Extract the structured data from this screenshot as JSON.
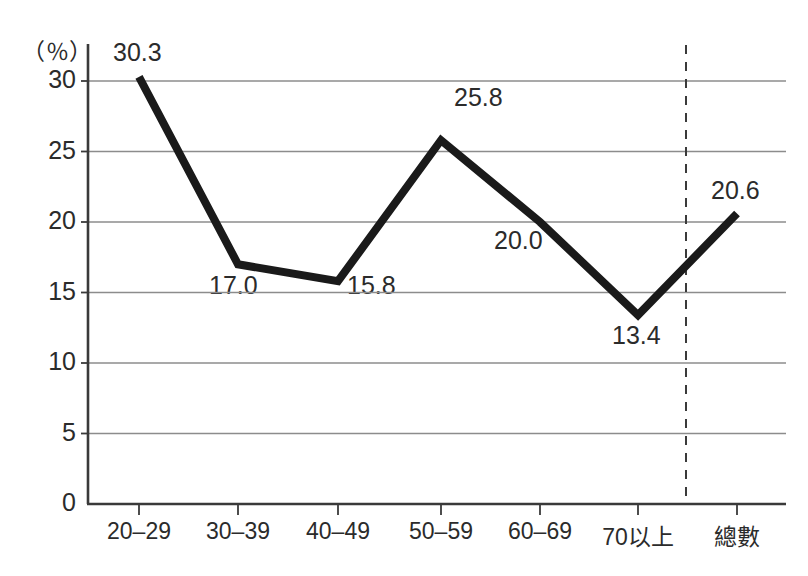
{
  "chart_data": {
    "type": "line",
    "title": "",
    "subtitle": "",
    "xlabel": "",
    "ylabel": "",
    "y_unit_label": "（％）",
    "categories": [
      "20–29",
      "30–39",
      "40–49",
      "50–59",
      "60–69",
      "70以上",
      "總數"
    ],
    "values": [
      30.3,
      17.0,
      15.8,
      25.8,
      20.0,
      13.4,
      20.6
    ],
    "point_labels": [
      "30.3",
      "17.0",
      "15.8",
      "25.8",
      "20.0",
      "13.4",
      "20.6"
    ],
    "ylim": [
      0,
      32
    ],
    "y_ticks": [
      0,
      5,
      10,
      15,
      20,
      25,
      30
    ],
    "y_tick_labels": [
      "0",
      "5",
      "10",
      "15",
      "20",
      "25",
      "30"
    ],
    "grid": "horizontal",
    "legend": "none",
    "separator": {
      "type": "dashed-vertical",
      "between": [
        "70以上",
        "總數"
      ],
      "note": "dashed rule separating age groups from total"
    },
    "series_color": "#1a1a1a",
    "grid_color": "#8c8c8c",
    "axis_color": "#3a3a3a",
    "text_color": "#2b2b2b",
    "background": "#ffffff"
  },
  "geometry": {
    "axis_x": 88,
    "baseline_y": 504,
    "grid_right": 786,
    "px_per_unit": 14.1,
    "tick_x": [
      139,
      238,
      338,
      441,
      540,
      638,
      737
    ],
    "separator_x": 686,
    "separator_y_top": 45,
    "point_label_positions": [
      {
        "x": 113,
        "y": 38
      },
      {
        "x": 209,
        "y": 271
      },
      {
        "x": 347,
        "y": 271
      },
      {
        "x": 454,
        "y": 83
      },
      {
        "x": 494,
        "y": 226
      },
      {
        "x": 612,
        "y": 321
      },
      {
        "x": 711,
        "y": 176
      }
    ],
    "y_tick_label_x": 20,
    "x_label_y": 518
  }
}
